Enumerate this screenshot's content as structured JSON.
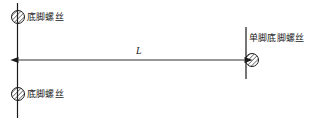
{
  "diagram": {
    "background_color": "#ffffff",
    "line_color": "#1a1a1a",
    "hatch_color": "#1a1a1a",
    "labels": {
      "top_left": "底脚螺丝",
      "bottom_left": "底脚螺丝",
      "right": "单脚底脚螺丝"
    },
    "dimension": {
      "symbol": "L",
      "line_y": 60,
      "start_x": 17,
      "end_x": 245,
      "arrow_style": "solid-triangle-both-ends"
    },
    "elements": {
      "left_wall": {
        "name": "left-vertical-line",
        "x": 17,
        "y_top": 3,
        "y_bottom": 118
      },
      "right_wall": {
        "name": "right-vertical-line",
        "x": 246,
        "y_top": 27,
        "y_bottom": 79
      },
      "screws": [
        {
          "name": "anchor-screw-top-left",
          "cx": 18,
          "cy": 17,
          "r": 6.5,
          "hatch": "diagonal"
        },
        {
          "name": "anchor-screw-bottom-left",
          "cx": 18,
          "cy": 94,
          "r": 6.5,
          "hatch": "diagonal"
        },
        {
          "name": "anchor-screw-right",
          "cx": 252,
          "cy": 60,
          "r": 6.5,
          "hatch": "diagonal"
        }
      ]
    }
  }
}
